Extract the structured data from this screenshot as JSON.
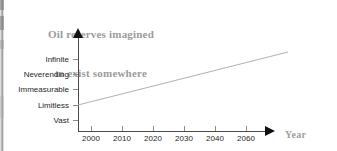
{
  "chart_data": {
    "type": "line",
    "title": "Oil reserves imagined to exist somewhere",
    "title_lines": [
      "Oil reserves imagined",
      "to exist somewhere"
    ],
    "xlabel": "Year",
    "ylabel": "",
    "grid": false,
    "legend": "none",
    "x_tick_labels": [
      "2000",
      "2010",
      "2020",
      "2030",
      "2040",
      "2060"
    ],
    "x_tick_values": [
      2000,
      2010,
      2020,
      2030,
      2040,
      2060
    ],
    "y_tick_labels": [
      "Infinite",
      "Neverending",
      "Immeasurable",
      "Limitless",
      "Vast"
    ],
    "y_tick_order_top_to_bottom": [
      "Infinite",
      "Neverending",
      "Immeasurable",
      "Limitless",
      "Vast"
    ],
    "xlim": [
      2000,
      2070
    ],
    "ylim": [
      "Vast",
      "Infinite"
    ],
    "series": [
      {
        "name": "Imagined oil reserves",
        "x": [
          2000,
          2070
        ],
        "y": [
          "Limitless",
          "Infinite"
        ],
        "color": "#b0b0b0",
        "points_px": [
          [
            78,
            105
          ],
          [
            288,
            52
          ]
        ]
      }
    ],
    "annotations": []
  },
  "axes": {
    "y_axis": {
      "arrow": "up-arrow-icon",
      "ticks": [
        {
          "label": "Infinite",
          "y": 59
        },
        {
          "label": "Neverending",
          "y": 74
        },
        {
          "label": "Immeasurable",
          "y": 89
        },
        {
          "label": "Limitless",
          "y": 105
        },
        {
          "label": "Vast",
          "y": 120
        }
      ]
    },
    "x_axis": {
      "arrow": "right-arrow-icon",
      "title": "Year",
      "ticks": [
        {
          "label": "2000",
          "x": 91
        },
        {
          "label": "2010",
          "x": 122
        },
        {
          "label": "2020",
          "x": 153
        },
        {
          "label": "2030",
          "x": 184
        },
        {
          "label": "2040",
          "x": 215
        },
        {
          "label": "2060",
          "x": 246
        },
        {
          "label": "",
          "x": 260
        }
      ]
    }
  },
  "colors": {
    "title": "#9b9b9b",
    "axis": "#4a4a4a",
    "arrow": "#111111",
    "tick": "#8c8c8c",
    "tick_label": "#1f1f1f",
    "series_line": "#b0b0b0",
    "background": "#ffffff"
  }
}
